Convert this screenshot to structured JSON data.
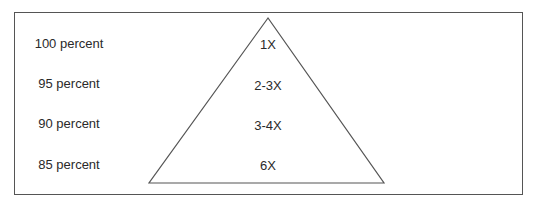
{
  "diagram": {
    "rows": [
      {
        "percent": "100 percent",
        "multiplier": "1X"
      },
      {
        "percent": "95 percent",
        "multiplier": "2-3X"
      },
      {
        "percent": "90 percent",
        "multiplier": "3-4X"
      },
      {
        "percent": "85 percent",
        "multiplier": "6X"
      }
    ],
    "shape": "triangle",
    "colors": {
      "line": "#555555",
      "text": "#2a2a2a",
      "background": "#ffffff"
    }
  }
}
